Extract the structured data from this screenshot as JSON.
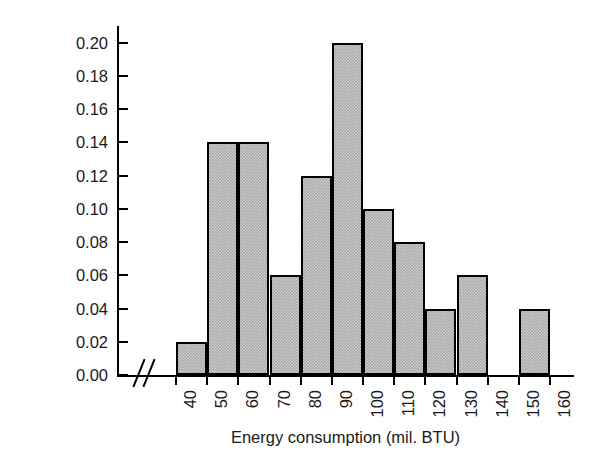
{
  "chart_data": {
    "type": "bar",
    "title": "",
    "subtitle": "",
    "xlabel": "Energy consumption (mil. BTU)",
    "ylabel": "Relative frequency",
    "grid": false,
    "legend": null,
    "legend_position": "none",
    "xlim": [
      40,
      160
    ],
    "ylim": [
      0.0,
      0.21
    ],
    "bin_width": 10,
    "axis_break": true,
    "axis_break_symbol": "//",
    "bar_fill_color": "#a9a9a9",
    "bar_edge_color": "#000000",
    "xticks": [
      40,
      50,
      60,
      70,
      80,
      90,
      100,
      110,
      120,
      130,
      140,
      150,
      160
    ],
    "xtick_labels": [
      "40",
      "50",
      "60",
      "70",
      "80",
      "90",
      "100",
      "110",
      "120",
      "130",
      "140",
      "150",
      "160"
    ],
    "xtick_label_rotation": -90,
    "yticks": [
      0.0,
      0.02,
      0.04,
      0.06,
      0.08,
      0.1,
      0.12,
      0.14,
      0.16,
      0.18,
      0.2
    ],
    "ytick_labels": [
      "0.00",
      "0.02",
      "0.04",
      "0.06",
      "0.08",
      "0.10",
      "0.12",
      "0.14",
      "0.16",
      "0.18",
      "0.20"
    ],
    "categories": [
      "40-50",
      "50-60",
      "60-70",
      "70-80",
      "80-90",
      "90-100",
      "100-110",
      "110-120",
      "120-130",
      "130-140",
      "140-150",
      "150-160"
    ],
    "bin_edges": [
      40,
      50,
      60,
      70,
      80,
      90,
      100,
      110,
      120,
      130,
      140,
      150,
      160
    ],
    "values": [
      0.02,
      0.14,
      0.14,
      0.06,
      0.12,
      0.2,
      0.1,
      0.08,
      0.04,
      0.06,
      0.0,
      0.04
    ],
    "bars": [
      {
        "bin_start": 40,
        "bin_end": 50,
        "value": 0.02,
        "label": "0.02"
      },
      {
        "bin_start": 50,
        "bin_end": 60,
        "value": 0.14,
        "label": "0.14"
      },
      {
        "bin_start": 60,
        "bin_end": 70,
        "value": 0.14,
        "label": "0.14"
      },
      {
        "bin_start": 70,
        "bin_end": 80,
        "value": 0.06,
        "label": "0.06"
      },
      {
        "bin_start": 80,
        "bin_end": 90,
        "value": 0.12,
        "label": "0.12"
      },
      {
        "bin_start": 90,
        "bin_end": 100,
        "value": 0.2,
        "label": "0.20"
      },
      {
        "bin_start": 100,
        "bin_end": 110,
        "value": 0.1,
        "label": "0.10"
      },
      {
        "bin_start": 110,
        "bin_end": 120,
        "value": 0.08,
        "label": "0.08"
      },
      {
        "bin_start": 120,
        "bin_end": 130,
        "value": 0.04,
        "label": "0.04"
      },
      {
        "bin_start": 130,
        "bin_end": 140,
        "value": 0.06,
        "label": "0.06"
      },
      {
        "bin_start": 140,
        "bin_end": 150,
        "value": 0.0,
        "label": "0.00"
      },
      {
        "bin_start": 150,
        "bin_end": 160,
        "value": 0.04,
        "label": "0.04"
      }
    ]
  }
}
